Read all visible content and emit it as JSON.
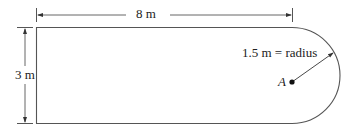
{
  "diagram": {
    "type": "racetrack-plate",
    "length_label": "8 m",
    "height_label": "3 m",
    "radius_label": "1.5 m = radius",
    "point_label": "A",
    "line_color": "#555555",
    "text_color": "#222222"
  }
}
